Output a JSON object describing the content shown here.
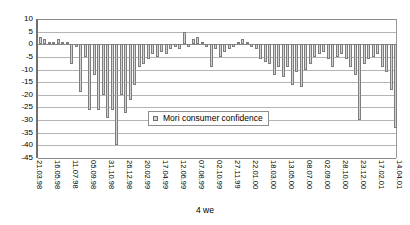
{
  "chart_data": {
    "type": "bar",
    "title": "",
    "xlabel": "4 we",
    "ylabel": "",
    "ylim": [
      -45,
      10
    ],
    "ytick_step": 5,
    "yticks": [
      10,
      5,
      0,
      -5,
      -10,
      -15,
      -20,
      -25,
      -30,
      -35,
      -40,
      -45
    ],
    "ytick_labels": [
      "10",
      "5",
      "0",
      "-5",
      "-10",
      "-15",
      "-20",
      "-25",
      "-30",
      "-35",
      "-40",
      "-45"
    ],
    "grid": true,
    "legend_position": "inside-center",
    "legend": [
      "Mori consumer confidence"
    ],
    "series": [
      {
        "name": "Mori consumer confidence",
        "color": "#d2d2d2",
        "edge_color": "#7d7d7d",
        "values": [
          3,
          2,
          1,
          1,
          2,
          1,
          1,
          -8,
          -1,
          -19,
          -5,
          -26,
          -12,
          -26,
          -20,
          -29,
          -26,
          -40,
          -20,
          -27,
          -22,
          -16,
          -9,
          -8,
          -6,
          -4,
          -5,
          -3,
          -4,
          -2,
          -1,
          -2,
          5,
          -1,
          2,
          3,
          1,
          -1,
          -9,
          -2,
          -5,
          -3,
          -2,
          -1,
          1,
          2,
          1,
          -1,
          -2,
          -6,
          -7,
          -8,
          -12,
          -9,
          -13,
          -9,
          -16,
          -11,
          -17,
          -10,
          -8,
          -5,
          -4,
          -3,
          -6,
          -9,
          -5,
          -4,
          -6,
          -9,
          -12,
          -30,
          -8,
          -6,
          -5,
          -4,
          -9,
          -11,
          -18,
          -33
        ]
      }
    ],
    "x_tick_labels": [
      "21.03.98",
      "16.05.98",
      "11.07.98",
      "05.09.98",
      "31.10.98",
      "26.12.98",
      "20.02.99",
      "17.04.99",
      "12.06.99",
      "07.08.99",
      "02.10.99",
      "27.11.99",
      "22.01.00",
      "18.03.00",
      "13.05.00",
      "08.07.00",
      "02.09.00",
      "28.10.00",
      "23.12.00",
      "17.02.01",
      "14.04.01",
      "09.06.01",
      "04.08.01"
    ],
    "x_tick_interval": 4,
    "n_points": 80
  }
}
